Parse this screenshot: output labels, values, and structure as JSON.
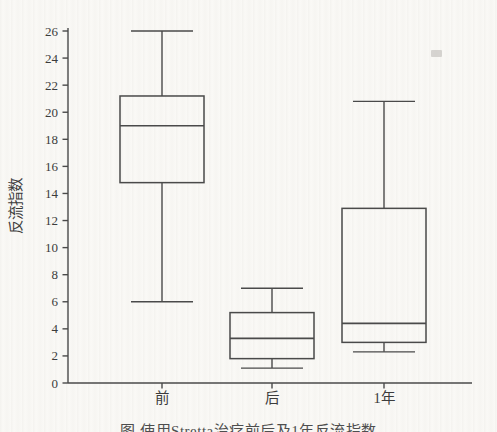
{
  "figure": {
    "caption": "图 使用Stretta治疗前后及1年反流指数",
    "background_color": "#faf9f6",
    "line_color": "#4a4a4a",
    "text_color": "#3c3c3c"
  },
  "chart_data": {
    "type": "boxplot",
    "title": "",
    "ylabel": "反流指数",
    "xlabel": "",
    "ylim": [
      0,
      26
    ],
    "ytick_step": 2,
    "grid": false,
    "categories": [
      "前",
      "后",
      "1年"
    ],
    "series": [
      {
        "category": "前",
        "whisker_low": 6.0,
        "q1": 14.8,
        "median": 19.0,
        "q3": 21.2,
        "whisker_high": 26.0
      },
      {
        "category": "后",
        "whisker_low": 1.1,
        "q1": 1.8,
        "median": 3.3,
        "q3": 5.2,
        "whisker_high": 7.0
      },
      {
        "category": "1年",
        "whisker_low": 2.3,
        "q1": 3.0,
        "median": 4.4,
        "q3": 12.9,
        "whisker_high": 20.8
      }
    ]
  }
}
